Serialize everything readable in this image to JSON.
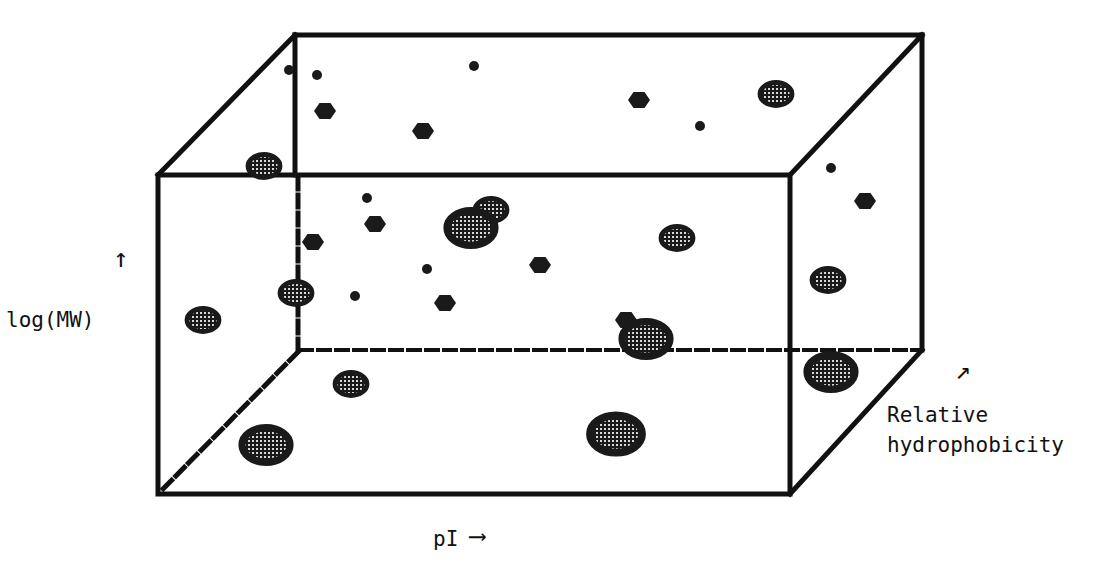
{
  "axes": {
    "y_label": "log(MW)",
    "y_arrow": "↑",
    "x_label": "pI",
    "x_arrow": "⟶",
    "z_label_line1": "Relative",
    "z_label_line2": "hydrophobicity",
    "z_arrow": "↗"
  },
  "colors": {
    "line": "#111111",
    "spot": "#1a1a1a",
    "spot_highlight": "#9a9a9a",
    "background": "#ffffff"
  },
  "chart_data": {
    "type": "scatter",
    "title": "",
    "xlabel": "pI",
    "ylabel": "log(MW)",
    "zlabel": "Relative hydrophobicity",
    "box": {
      "front": {
        "x1": 158,
        "y1": 175,
        "x2": 790,
        "y2": 494
      },
      "back": {
        "x1": 295,
        "y1": 35,
        "x2": 922,
        "y2": 350
      }
    },
    "spots": [
      {
        "x": 289,
        "y": 70,
        "r": 5,
        "shape": "dot"
      },
      {
        "x": 317,
        "y": 75,
        "r": 5,
        "shape": "dot"
      },
      {
        "x": 474,
        "y": 66,
        "r": 5,
        "shape": "dot"
      },
      {
        "x": 325,
        "y": 111,
        "r": 10,
        "shape": "hex"
      },
      {
        "x": 423,
        "y": 131,
        "r": 10,
        "shape": "hex"
      },
      {
        "x": 639,
        "y": 100,
        "r": 10,
        "shape": "hex"
      },
      {
        "x": 700,
        "y": 126,
        "r": 5,
        "shape": "dot"
      },
      {
        "x": 776,
        "y": 94,
        "r": 16,
        "shape": "oval"
      },
      {
        "x": 264,
        "y": 166,
        "r": 16,
        "shape": "oval"
      },
      {
        "x": 831,
        "y": 168,
        "r": 5,
        "shape": "dot"
      },
      {
        "x": 865,
        "y": 201,
        "r": 10,
        "shape": "hex"
      },
      {
        "x": 367,
        "y": 198,
        "r": 5,
        "shape": "dot"
      },
      {
        "x": 375,
        "y": 224,
        "r": 10,
        "shape": "hex"
      },
      {
        "x": 491,
        "y": 210,
        "r": 16,
        "shape": "oval"
      },
      {
        "x": 471,
        "y": 228,
        "r": 24,
        "shape": "oval"
      },
      {
        "x": 313,
        "y": 242,
        "r": 10,
        "shape": "hex"
      },
      {
        "x": 677,
        "y": 238,
        "r": 16,
        "shape": "oval"
      },
      {
        "x": 427,
        "y": 269,
        "r": 5,
        "shape": "dot"
      },
      {
        "x": 540,
        "y": 265,
        "r": 10,
        "shape": "hex"
      },
      {
        "x": 828,
        "y": 280,
        "r": 16,
        "shape": "oval"
      },
      {
        "x": 296,
        "y": 293,
        "r": 16,
        "shape": "oval"
      },
      {
        "x": 355,
        "y": 296,
        "r": 5,
        "shape": "dot"
      },
      {
        "x": 445,
        "y": 303,
        "r": 10,
        "shape": "hex"
      },
      {
        "x": 203,
        "y": 320,
        "r": 16,
        "shape": "oval"
      },
      {
        "x": 626,
        "y": 320,
        "r": 10,
        "shape": "hex"
      },
      {
        "x": 646,
        "y": 339,
        "r": 24,
        "shape": "oval"
      },
      {
        "x": 831,
        "y": 372,
        "r": 24,
        "shape": "oval"
      },
      {
        "x": 351,
        "y": 384,
        "r": 16,
        "shape": "oval"
      },
      {
        "x": 266,
        "y": 445,
        "r": 24,
        "shape": "oval"
      },
      {
        "x": 616,
        "y": 434,
        "r": 26,
        "shape": "oval"
      }
    ]
  }
}
